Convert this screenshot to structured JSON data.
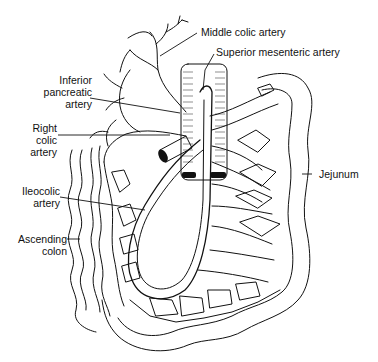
{
  "figure": {
    "labels": {
      "middle_colic_artery": "Middle colic artery",
      "superior_mesenteric_artery": "Superior mesenteric artery",
      "inferior_pancreatic_artery": [
        "Inferior",
        "pancreatic",
        "artery"
      ],
      "right_colic_artery": [
        "Right",
        "colic",
        "artery"
      ],
      "ileocolic_artery": [
        "Ileocolic",
        "artery"
      ],
      "ascending_colon": [
        "Ascending",
        "colon"
      ],
      "jejunum": "Jejunum"
    }
  }
}
